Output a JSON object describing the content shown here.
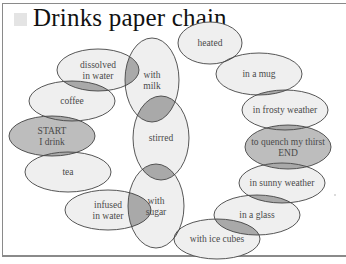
{
  "title": "Drinks paper chain",
  "title_icon": "square-bullet-icon",
  "colors": {
    "node_fill": "#efefef",
    "terminal_fill": "#bdbdbd",
    "overlap_fill": "#a9a9a9",
    "stroke": "#444444",
    "frame": "#8a8a8a",
    "text": "#4a4a4a"
  },
  "nodes": [
    {
      "id": "dissolved-in-water",
      "lines": [
        "dissolved",
        "in water"
      ],
      "cx": 98,
      "cy": 70,
      "rx": 41,
      "ry": 21,
      "type": "normal"
    },
    {
      "id": "coffee",
      "lines": [
        "coffee"
      ],
      "cx": 72,
      "cy": 101,
      "rx": 43,
      "ry": 20,
      "type": "normal"
    },
    {
      "id": "start-i-drink",
      "lines": [
        "START",
        "I drink"
      ],
      "cx": 52,
      "cy": 136,
      "rx": 43,
      "ry": 20,
      "type": "terminal"
    },
    {
      "id": "tea",
      "lines": [
        "tea"
      ],
      "cx": 68,
      "cy": 172,
      "rx": 43,
      "ry": 20,
      "type": "normal"
    },
    {
      "id": "infused-in-water",
      "lines": [
        "infused",
        "in water"
      ],
      "cx": 108,
      "cy": 210,
      "rx": 43,
      "ry": 20,
      "type": "normal"
    },
    {
      "id": "with-milk",
      "lines": [
        "with",
        "milk"
      ],
      "cx": 152,
      "cy": 80,
      "rx": 27,
      "ry": 42,
      "type": "normal"
    },
    {
      "id": "stirred",
      "lines": [
        "stirred"
      ],
      "cx": 161,
      "cy": 138,
      "rx": 28,
      "ry": 42,
      "type": "normal"
    },
    {
      "id": "with-sugar",
      "lines": [
        "with",
        "sugar"
      ],
      "cx": 156,
      "cy": 206,
      "rx": 28,
      "ry": 42,
      "type": "normal"
    },
    {
      "id": "heated",
      "lines": [
        "heated"
      ],
      "cx": 210,
      "cy": 43,
      "rx": 32,
      "ry": 21,
      "type": "normal"
    },
    {
      "id": "in-a-mug",
      "lines": [
        "in a mug"
      ],
      "cx": 259,
      "cy": 74,
      "rx": 43,
      "ry": 21,
      "type": "normal"
    },
    {
      "id": "in-frosty-weather",
      "lines": [
        "in frosty weather"
      ],
      "cx": 285,
      "cy": 110,
      "rx": 43,
      "ry": 20,
      "type": "normal"
    },
    {
      "id": "to-quench-my-thirst-end",
      "lines": [
        "to quench my thirst",
        "END"
      ],
      "cx": 288,
      "cy": 147,
      "rx": 43,
      "ry": 22,
      "type": "terminal"
    },
    {
      "id": "in-sunny-weather",
      "lines": [
        "in sunny weather"
      ],
      "cx": 282,
      "cy": 183,
      "rx": 43,
      "ry": 20,
      "type": "normal"
    },
    {
      "id": "in-a-glass",
      "lines": [
        "in a glass"
      ],
      "cx": 257,
      "cy": 215,
      "rx": 43,
      "ry": 20,
      "type": "normal"
    },
    {
      "id": "with-ice-cubes",
      "lines": [
        "with ice cubes"
      ],
      "cx": 217,
      "cy": 239,
      "rx": 43,
      "ry": 20,
      "type": "normal"
    }
  ],
  "links": [
    [
      "dissolved-in-water",
      "coffee"
    ],
    [
      "coffee",
      "start-i-drink"
    ],
    [
      "start-i-drink",
      "tea"
    ],
    [
      "tea",
      "infused-in-water"
    ],
    [
      "dissolved-in-water",
      "with-milk"
    ],
    [
      "infused-in-water",
      "with-sugar"
    ],
    [
      "with-milk",
      "stirred"
    ],
    [
      "stirred",
      "with-sugar"
    ],
    [
      "with-milk",
      "heated"
    ],
    [
      "with-sugar",
      "with-ice-cubes"
    ],
    [
      "heated",
      "in-a-mug"
    ],
    [
      "in-a-mug",
      "in-frosty-weather"
    ],
    [
      "in-frosty-weather",
      "to-quench-my-thirst-end"
    ],
    [
      "to-quench-my-thirst-end",
      "in-sunny-weather"
    ],
    [
      "in-sunny-weather",
      "in-a-glass"
    ],
    [
      "in-a-glass",
      "with-ice-cubes"
    ]
  ]
}
